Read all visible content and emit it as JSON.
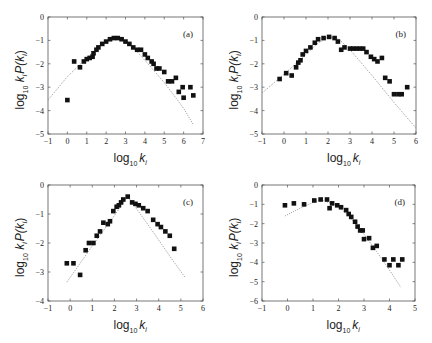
{
  "chart_data": [
    {
      "panel_label": "(a)",
      "type": "scatter",
      "xlabel": "log10 k_i",
      "ylabel": "log10 k_i P(k_i)",
      "xlim": [
        -1,
        7
      ],
      "ylim": [
        -5,
        0
      ],
      "xticks": [
        "-1",
        "0",
        "1",
        "2",
        "3",
        "4",
        "5",
        "6",
        "7"
      ],
      "yticks": [
        "0",
        "-1",
        "-2",
        "-3",
        "-4",
        "-5"
      ],
      "grid": false,
      "series": [
        {
          "name": "data",
          "marker": "square",
          "x": [
            0,
            0.35,
            0.65,
            0.85,
            1.0,
            1.15,
            1.3,
            1.35,
            1.5,
            1.6,
            1.8,
            2.0,
            2.2,
            2.4,
            2.6,
            2.8,
            3.0,
            3.2,
            3.4,
            3.6,
            3.8,
            4.0,
            4.15,
            4.35,
            4.45,
            4.6,
            4.75,
            5.0,
            5.2,
            5.4,
            5.6,
            5.75,
            5.95,
            6.0,
            6.35,
            6.5
          ],
          "y": [
            -3.55,
            -1.9,
            -2.15,
            -1.9,
            -1.8,
            -1.75,
            -1.7,
            -1.55,
            -1.4,
            -1.3,
            -1.15,
            -1.05,
            -0.95,
            -0.9,
            -0.9,
            -0.95,
            -1.05,
            -1.15,
            -1.3,
            -1.4,
            -1.4,
            -1.6,
            -1.75,
            -1.9,
            -2.0,
            -2.2,
            -2.2,
            -2.35,
            -2.75,
            -2.75,
            -2.6,
            -3.2,
            -3.0,
            -3.45,
            -3.0,
            -3.35
          ]
        },
        {
          "name": "fit",
          "style": "dotted",
          "x": [
            -1,
            0,
            1,
            1.5,
            2,
            2.5,
            3,
            3.5,
            4,
            5,
            6,
            6.5
          ],
          "y": [
            -3.55,
            -2.55,
            -1.75,
            -1.35,
            -1.05,
            -0.9,
            -1.05,
            -1.4,
            -1.85,
            -2.8,
            -3.9,
            -4.6
          ]
        }
      ]
    },
    {
      "panel_label": "(b)",
      "type": "scatter",
      "xlabel": "log10 k_i",
      "ylabel": "log10 k_i P(k_i)",
      "xlim": [
        -1,
        6
      ],
      "ylim": [
        -5,
        0
      ],
      "xticks": [
        "-1",
        "0",
        "1",
        "2",
        "3",
        "4",
        "5",
        "6"
      ],
      "yticks": [
        "0",
        "-1",
        "-2",
        "-3",
        "-4",
        "-5"
      ],
      "grid": false,
      "series": [
        {
          "name": "data",
          "marker": "square",
          "x": [
            -0.2,
            0.1,
            0.35,
            0.55,
            0.65,
            0.75,
            0.85,
            1.0,
            1.2,
            1.4,
            1.55,
            1.8,
            2.05,
            2.3,
            2.45,
            2.6,
            2.75,
            3.0,
            3.15,
            3.3,
            3.45,
            3.6,
            3.75,
            3.95,
            4.1,
            4.25,
            4.45,
            4.6,
            4.8,
            5.0,
            5.2,
            5.35,
            5.6
          ],
          "y": [
            -2.65,
            -2.4,
            -2.5,
            -2.15,
            -1.95,
            -1.85,
            -1.6,
            -1.45,
            -1.3,
            -1.1,
            -0.95,
            -0.9,
            -0.85,
            -0.9,
            -1.05,
            -1.4,
            -1.3,
            -1.35,
            -1.35,
            -1.35,
            -1.35,
            -1.35,
            -1.5,
            -1.7,
            -1.8,
            -1.9,
            -1.75,
            -2.6,
            -2.75,
            -3.3,
            -3.3,
            -3.3,
            -3.0
          ]
        },
        {
          "name": "fit",
          "style": "dotted",
          "x": [
            -1,
            0,
            1,
            1.5,
            2,
            2.5,
            3,
            4,
            5,
            6
          ],
          "y": [
            -3.25,
            -2.45,
            -1.6,
            -1.15,
            -0.85,
            -0.95,
            -1.4,
            -2.5,
            -3.65,
            -4.75
          ]
        }
      ]
    },
    {
      "panel_label": "(c)",
      "type": "scatter",
      "xlabel": "log10 k_i",
      "ylabel": "log10 k_i P(k_i)",
      "xlim": [
        -1,
        6
      ],
      "ylim": [
        -4,
        0
      ],
      "xticks": [
        "-1",
        "0",
        "1",
        "2",
        "3",
        "4",
        "5",
        "6"
      ],
      "yticks": [
        "0",
        "-1",
        "-2",
        "-3",
        "-4"
      ],
      "grid": false,
      "series": [
        {
          "name": "data",
          "marker": "square",
          "x": [
            -0.15,
            0.15,
            0.45,
            0.7,
            0.85,
            1.05,
            1.2,
            1.35,
            1.5,
            1.7,
            1.8,
            1.95,
            2.1,
            2.2,
            2.3,
            2.4,
            2.6,
            2.8,
            2.95,
            3.1,
            3.3,
            3.5,
            3.75,
            3.95,
            4.1,
            4.3,
            4.5,
            4.7
          ],
          "y": [
            -2.7,
            -2.7,
            -3.1,
            -2.25,
            -2.0,
            -2.0,
            -1.75,
            -1.6,
            -1.3,
            -1.35,
            -1.25,
            -0.9,
            -0.75,
            -0.7,
            -0.6,
            -0.5,
            -0.4,
            -0.6,
            -0.65,
            -0.7,
            -0.8,
            -0.9,
            -1.2,
            -1.35,
            -1.45,
            -1.6,
            -1.75,
            -2.2
          ]
        },
        {
          "name": "fit",
          "style": "dotted",
          "x": [
            -0.15,
            1.0,
            2.0,
            2.6,
            3.5,
            4.5,
            5.2
          ],
          "y": [
            -3.35,
            -2.1,
            -1.05,
            -0.4,
            -1.35,
            -2.45,
            -3.2
          ]
        }
      ]
    },
    {
      "panel_label": "(d)",
      "type": "scatter",
      "xlabel": "log10 k_i",
      "ylabel": "log10 k_i P(k_i)",
      "xlim": [
        -1,
        5
      ],
      "ylim": [
        -6,
        0
      ],
      "xticks": [
        "-1",
        "0",
        "1",
        "2",
        "3",
        "4",
        "5"
      ],
      "yticks": [
        "0",
        "-1",
        "-2",
        "-3",
        "-4",
        "-5",
        "-6"
      ],
      "grid": false,
      "series": [
        {
          "name": "data",
          "marker": "square",
          "x": [
            -0.1,
            0.25,
            0.65,
            1.05,
            1.3,
            1.55,
            1.65,
            1.75,
            1.95,
            2.1,
            2.3,
            2.4,
            2.5,
            2.65,
            2.75,
            2.85,
            2.95,
            3.0,
            3.2,
            3.35,
            3.5,
            3.8,
            4.0,
            4.15,
            4.35,
            4.5
          ],
          "y": [
            -1.05,
            -0.95,
            -1.0,
            -0.8,
            -0.75,
            -0.75,
            -1.2,
            -0.95,
            -1.05,
            -1.15,
            -1.3,
            -1.5,
            -1.65,
            -1.9,
            -2.15,
            -2.35,
            -2.35,
            -2.8,
            -2.75,
            -3.25,
            -3.15,
            -3.85,
            -4.15,
            -3.85,
            -4.15,
            -3.85
          ]
        },
        {
          "name": "fit",
          "style": "dotted",
          "x": [
            -0.1,
            0.5,
            1.0,
            1.3,
            2.0,
            2.5,
            3.0,
            3.5,
            4.0,
            4.45
          ],
          "y": [
            -1.6,
            -1.2,
            -0.9,
            -0.75,
            -1.1,
            -1.75,
            -2.55,
            -3.45,
            -4.4,
            -5.3
          ]
        }
      ]
    }
  ],
  "panels": [
    {
      "label": "(a)",
      "xlabel_main": "log",
      "xlabel_sub": "10",
      "xlabel_var": "k",
      "xlabel_varsub": "i"
    },
    {
      "label": "(b)",
      "xlabel_main": "log",
      "xlabel_sub": "10",
      "xlabel_var": "k",
      "xlabel_varsub": "i"
    },
    {
      "label": "(c)",
      "xlabel_main": "log",
      "xlabel_sub": "10",
      "xlabel_var": "k",
      "xlabel_varsub": "i"
    },
    {
      "label": "(d)",
      "xlabel_main": "log",
      "xlabel_sub": "10",
      "xlabel_var": "k",
      "xlabel_varsub": "i"
    }
  ],
  "ylabel_text": {
    "main": "log",
    "sub": "10",
    "rest": " k",
    "ksub": "i",
    "tail": "P(k",
    "tailsub": "i",
    "close": ")"
  }
}
